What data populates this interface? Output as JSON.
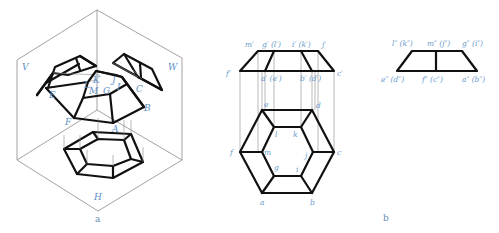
{
  "figure_a": {
    "caption": "a",
    "planes": {
      "V": "V",
      "W": "W",
      "H": "H"
    },
    "vertices": {
      "A": "A",
      "B": "B",
      "C": "C",
      "E": "E",
      "F": "F",
      "G": "G",
      "I": "I",
      "J": "J",
      "K": "K",
      "L": "L",
      "M": "M"
    }
  },
  "figure_b": {
    "caption": "b",
    "front_view": {
      "top_labels": {
        "m": "m′",
        "g": "g′ (l′)",
        "i": "i′ (k′)",
        "j": "j′"
      },
      "bottom_labels": {
        "f": "f′",
        "a": "a′ (e′)",
        "b": "b′ (d′)",
        "c": "c′"
      }
    },
    "top_view": {
      "outer": {
        "a": "a",
        "b": "b",
        "c": "c",
        "d": "d",
        "e": "e",
        "f": "f"
      },
      "inner": {
        "g": "g",
        "i": "i",
        "j": "j",
        "k": "k",
        "l": "l",
        "m": "m"
      }
    },
    "side_view": {
      "top_labels": {
        "l": "l″ (k″)",
        "m": "m″ (j″)",
        "g": "g″ (i″)"
      },
      "bottom_labels": {
        "e": "e″ (d″)",
        "f": "f″ (c″)",
        "a": "a″ (b″)"
      }
    }
  }
}
